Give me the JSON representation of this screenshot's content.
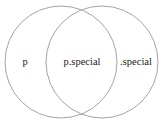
{
  "figure": {
    "type": "venn-diagram",
    "background_color": "#ffffff",
    "stroke_color": "#9a9a9a",
    "text_color": "#1a1a1a",
    "regions": {
      "left_only": "p",
      "intersection": "p.special",
      "right_only": ".special"
    },
    "circles": [
      {
        "name": "left-circle",
        "cx": 61,
        "cy": 62,
        "r": 56
      },
      {
        "name": "right-circle",
        "cx": 102,
        "cy": 62,
        "r": 56
      }
    ]
  }
}
